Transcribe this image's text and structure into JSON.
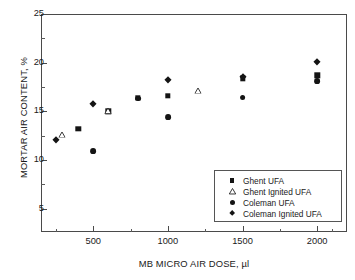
{
  "chart_data": {
    "type": "scatter",
    "title": "",
    "xlabel": "MB MICRO AIR DOSE, µl",
    "ylabel": "MORTAR AIR CONTENT, %",
    "xlim": [
      150,
      2200
    ],
    "ylim": [
      2.6,
      25
    ],
    "grid": false,
    "legend_position": "lower right",
    "x_ticks": [
      500,
      1000,
      1500,
      2000
    ],
    "x_tick_labels": [
      "500",
      "1000",
      "1500",
      "2000"
    ],
    "x_minor_ticks": [
      250,
      750,
      1250,
      1750,
      2100
    ],
    "y_ticks": [
      5,
      10,
      15,
      20,
      25
    ],
    "y_tick_labels": [
      "5",
      "10",
      "15",
      "20",
      "25"
    ],
    "y_minor_ticks": [
      7.5,
      12.5,
      17.5,
      22.5
    ],
    "series": [
      {
        "name": "Ghent UFA",
        "marker": "square",
        "color": "#141414",
        "points": [
          {
            "x": 400,
            "y": 13.2
          },
          {
            "x": 600,
            "y": 15.0
          },
          {
            "x": 800,
            "y": 16.4
          },
          {
            "x": 1000,
            "y": 16.6
          },
          {
            "x": 1500,
            "y": 18.4
          },
          {
            "x": 2000,
            "y": 18.7
          }
        ]
      },
      {
        "name": "Ghent Ignited UFA",
        "marker": "triangle",
        "color": "#141414",
        "points": [
          {
            "x": 290,
            "y": 12.6
          },
          {
            "x": 600,
            "y": 15.0
          },
          {
            "x": 1200,
            "y": 17.1
          }
        ]
      },
      {
        "name": "Coleman UFA",
        "marker": "circle",
        "color": "#141414",
        "points": [
          {
            "x": 500,
            "y": 10.9
          },
          {
            "x": 800,
            "y": 16.3
          },
          {
            "x": 1000,
            "y": 14.4
          },
          {
            "x": 1500,
            "y": 16.4
          },
          {
            "x": 2000,
            "y": 18.1
          }
        ]
      },
      {
        "name": "Coleman Ignited UFA",
        "marker": "diamond",
        "color": "#141414",
        "points": [
          {
            "x": 250,
            "y": 12.1
          },
          {
            "x": 500,
            "y": 15.8
          },
          {
            "x": 1000,
            "y": 18.2
          },
          {
            "x": 1500,
            "y": 18.5
          },
          {
            "x": 2000,
            "y": 20.1
          }
        ]
      }
    ]
  },
  "legend": {
    "entries": [
      {
        "label": "Ghent UFA",
        "marker": "square"
      },
      {
        "label": "Ghent Ignited UFA",
        "marker": "triangle"
      },
      {
        "label": "Coleman UFA",
        "marker": "circle"
      },
      {
        "label": "Coleman Ignited UFA",
        "marker": "diamond"
      }
    ]
  }
}
